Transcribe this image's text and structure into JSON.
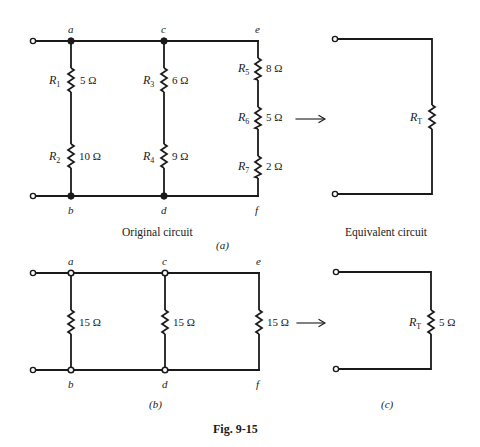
{
  "figure": {
    "title": "Fig. 9-15",
    "colors": {
      "ink": "#1a1a1a",
      "background": "#ffffff"
    }
  },
  "panel_a": {
    "part_label": "(a)",
    "original_caption": "Original circuit",
    "equivalent_caption": "Equivalent circuit",
    "nodes": {
      "a": "a",
      "b": "b",
      "c": "c",
      "d": "d",
      "e": "e",
      "f": "f"
    },
    "resistors": [
      {
        "name": "R",
        "sub": "1",
        "value": "5 Ω"
      },
      {
        "name": "R",
        "sub": "2",
        "value": "10 Ω"
      },
      {
        "name": "R",
        "sub": "3",
        "value": "6 Ω"
      },
      {
        "name": "R",
        "sub": "4",
        "value": "9 Ω"
      },
      {
        "name": "R",
        "sub": "5",
        "value": "8 Ω"
      },
      {
        "name": "R",
        "sub": "6",
        "value": "5 Ω"
      },
      {
        "name": "R",
        "sub": "7",
        "value": "2 Ω"
      }
    ],
    "equivalent": {
      "name": "R",
      "sub": "T",
      "value": ""
    }
  },
  "panel_b": {
    "part_label": "(b)",
    "nodes": {
      "a": "a",
      "b": "b",
      "c": "c",
      "d": "d",
      "e": "e",
      "f": "f"
    },
    "resistors": [
      {
        "value": "15 Ω"
      },
      {
        "value": "15 Ω"
      },
      {
        "value": "15 Ω"
      }
    ]
  },
  "panel_c": {
    "part_label": "(c)",
    "equivalent": {
      "name": "R",
      "sub": "T",
      "value": "5 Ω"
    }
  },
  "arrows": {
    "glyph": "→"
  }
}
